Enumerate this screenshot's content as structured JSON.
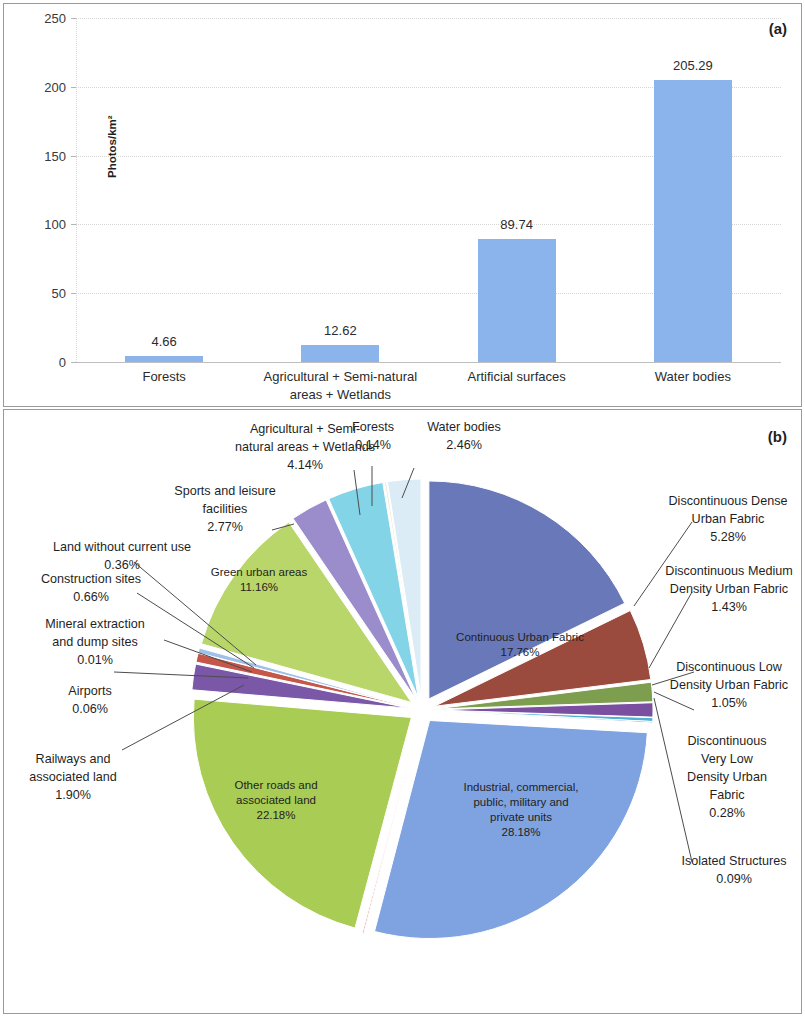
{
  "figure": {
    "panel_a_tag": "(a)",
    "panel_b_tag": "(b)"
  },
  "chart_data": [
    {
      "type": "bar",
      "panel": "(a)",
      "title": "",
      "xlabel": "",
      "ylabel": "Photos/km²",
      "ylim": [
        0,
        250
      ],
      "yticks": [
        "0",
        "50",
        "100",
        "150",
        "200",
        "250"
      ],
      "grid": true,
      "legend": "none",
      "bar_color": "#8cb4ec",
      "categories": [
        "Forests",
        "Agricultural + Semi-natural\nareas + Wetlands",
        "Artificial surfaces",
        "Water bodies"
      ],
      "values": [
        4.66,
        12.62,
        89.74,
        205.29
      ],
      "value_labels": [
        "4.66",
        "12.62",
        "89.74",
        "205.29"
      ]
    },
    {
      "type": "pie",
      "panel": "(b)",
      "title": "",
      "exploded": true,
      "labels": [
        "Continuous Urban Fabric",
        "Discontinuous Dense Urban Fabric",
        "Discontinuous Medium Density Urban Fabric",
        "Discontinuous Low Density Urban Fabric",
        "Discontinuous Very Low Density Urban Fabric",
        "Isolated Structures",
        "Industrial, commercial, public, military and private units",
        "Fast transit roads and associated land",
        "Other roads and associated land",
        "Railways and associated land",
        "Airports",
        "Mineral extraction and dump sites",
        "Construction sites",
        "Land without current use",
        "Green urban areas",
        "Sports and leisure facilities",
        "Agricultural + Semi-natural areas + Wetlands",
        "Forests",
        "Water bodies"
      ],
      "values": [
        17.76,
        5.28,
        1.43,
        1.05,
        0.28,
        0.09,
        28.18,
        0.09,
        22.18,
        1.9,
        0.06,
        0.01,
        0.66,
        0.36,
        11.16,
        2.77,
        4.14,
        0.14,
        2.46
      ],
      "value_labels": [
        "17.76%",
        "5.28%",
        "1.43%",
        "1.05%",
        "0.28%",
        "0.09%",
        "28.18%",
        "0.09%",
        "22.18%",
        "1.90%",
        "0.06%",
        "0.01%",
        "0.66%",
        "0.36%",
        "11.16%",
        "2.77%",
        "4.14%",
        "0.14%",
        "2.46%"
      ],
      "colors": [
        "#6878b8",
        "#9b4b3e",
        "#7d9e4e",
        "#7a4fa0",
        "#52b2d4",
        "#3b6fbd",
        "#7fa2e0",
        "#d06a6a",
        "#a9cc54",
        "#7b57a8",
        "#52b2d4",
        "#4e80c4",
        "#c4574a",
        "#9fc0e8",
        "#b9d66a",
        "#9b8ccb",
        "#84d4e8",
        "#efe7cf",
        "#dbecf6"
      ]
    }
  ],
  "panel_a": {
    "tag": "(a)",
    "y_axis_title": "Photos/km²",
    "y_ticks": [
      {
        "label": "250",
        "value": 250
      },
      {
        "label": "200",
        "value": 200
      },
      {
        "label": "150",
        "value": 150
      },
      {
        "label": "100",
        "value": 100
      },
      {
        "label": "50",
        "value": 50
      },
      {
        "label": "0",
        "value": 0
      }
    ],
    "bars": [
      {
        "category": "Forests",
        "value": 4.66,
        "label": "4.66"
      },
      {
        "category": "Agricultural + Semi-natural\nareas + Wetlands",
        "value": 12.62,
        "label": "12.62"
      },
      {
        "category": "Artificial surfaces",
        "value": 89.74,
        "label": "89.74"
      },
      {
        "category": "Water bodies",
        "value": 205.29,
        "label": "205.29"
      }
    ]
  },
  "panel_b": {
    "tag": "(b)",
    "inside_labels": [
      {
        "name": "Continuous Urban Fabric",
        "pct": "17.76%",
        "text": "Continuous Urban Fabric\n17.76%"
      },
      {
        "name": "Industrial, commercial, public, military and private units",
        "pct": "28.18%",
        "text": "Industrial, commercial,\npublic, military and\nprivate units\n28.18%"
      },
      {
        "name": "Other roads and associated land",
        "pct": "22.18%",
        "text": "Other roads and\nassociated land\n22.18%"
      },
      {
        "name": "Green urban areas",
        "pct": "11.16%",
        "text": "Green urban areas\n11.16%"
      }
    ],
    "outside_labels": [
      {
        "name": "Agricultural + Semi-natural areas + Wetlands",
        "pct": "4.14%",
        "text": "Agricultural + Semi-\nnatural areas + Wetlands\n4.14%"
      },
      {
        "name": "Forests",
        "pct": "0.14%",
        "text": "Forests\n0.14%"
      },
      {
        "name": "Water bodies",
        "pct": "2.46%",
        "text": "Water bodies\n2.46%"
      },
      {
        "name": "Sports and leisure facilities",
        "pct": "2.77%",
        "text": "Sports and leisure\nfacilities\n2.77%"
      },
      {
        "name": "Land without current use",
        "pct": "0.36%",
        "text": "Land without current use\n0.36%"
      },
      {
        "name": "Construction sites",
        "pct": "0.66%",
        "text": "Construction sites\n0.66%"
      },
      {
        "name": "Mineral extraction and dump sites",
        "pct": "0.01%",
        "text": "Mineral extraction\nand dump sites\n0.01%"
      },
      {
        "name": "Airports",
        "pct": "0.06%",
        "text": "Airports\n0.06%"
      },
      {
        "name": "Railways and associated land",
        "pct": "1.90%",
        "text": "Railways and\nassociated land\n1.90%"
      },
      {
        "name": "Fast transit roads and associated land",
        "pct": "0.09%",
        "text": "Fast transit roads and\nassociated land\n0.09%"
      },
      {
        "name": "Discontinuous Dense Urban Fabric",
        "pct": "5.28%",
        "text": "Discontinuous Dense\nUrban Fabric\n5.28%"
      },
      {
        "name": "Discontinuous Medium Density Urban Fabric",
        "pct": "1.43%",
        "text": "Discontinuous Medium\nDensity Urban Fabric\n1.43%"
      },
      {
        "name": "Discontinuous Low Density Urban Fabric",
        "pct": "1.05%",
        "text": "Discontinuous Low\nDensity Urban Fabric\n1.05%"
      },
      {
        "name": "Discontinuous Very Low Density Urban Fabric",
        "pct": "0.28%",
        "text": "Discontinuous\nVery Low\nDensity Urban\nFabric\n0.28%"
      },
      {
        "name": "Isolated Structures",
        "pct": "0.09%",
        "text": "Isolated Structures\n0.09%"
      }
    ]
  }
}
